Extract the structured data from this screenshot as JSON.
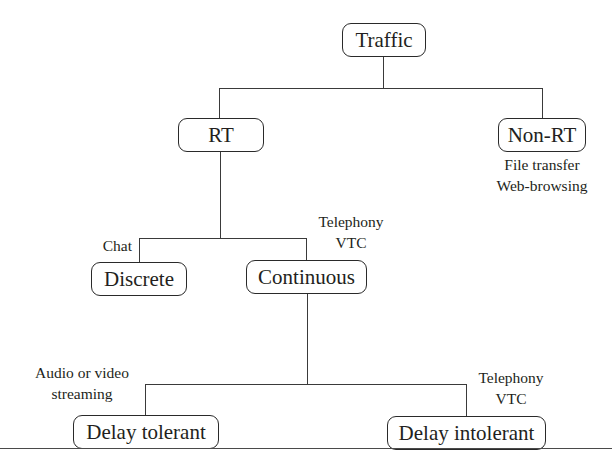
{
  "diagram": {
    "type": "tree",
    "root": {
      "label": "Traffic",
      "children": [
        {
          "label": "RT",
          "children": [
            {
              "label": "Discrete",
              "annotation": [
                "Chat"
              ]
            },
            {
              "label": "Continuous",
              "annotation": [
                "Telephony",
                "VTC"
              ],
              "children": [
                {
                  "label": "Delay tolerant",
                  "annotation": [
                    "Audio or video",
                    "streaming"
                  ]
                },
                {
                  "label": "Delay intolerant",
                  "annotation": [
                    "Telephony",
                    "VTC"
                  ]
                }
              ]
            }
          ]
        },
        {
          "label": "Non-RT",
          "annotation": [
            "File transfer",
            "Web-browsing"
          ]
        }
      ]
    }
  },
  "nodes": {
    "traffic": "Traffic",
    "rt": "RT",
    "non_rt": "Non-RT",
    "discrete": "Discrete",
    "continuous": "Continuous",
    "delay_tolerant": "Delay tolerant",
    "delay_intolerant": "Delay intolerant"
  },
  "annotations": {
    "non_rt_line1": "File transfer",
    "non_rt_line2": "Web-browsing",
    "discrete": "Chat",
    "continuous_line1": "Telephony",
    "continuous_line2": "VTC",
    "delay_tolerant_line1": "Audio or video",
    "delay_tolerant_line2": "streaming",
    "delay_intolerant_line1": "Telephony",
    "delay_intolerant_line2": "VTC"
  }
}
